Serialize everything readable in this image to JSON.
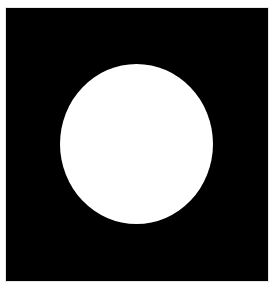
{
  "image": {
    "background_color": "#000000",
    "border_color": "#ffffff",
    "shape": {
      "type": "ellipse",
      "fill": "#ffffff"
    }
  }
}
